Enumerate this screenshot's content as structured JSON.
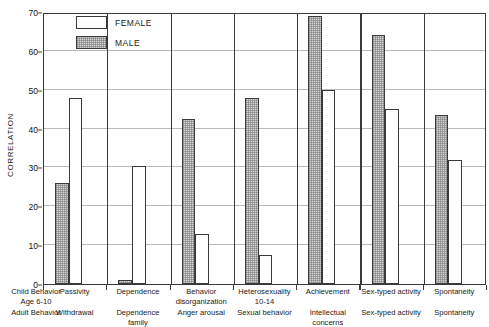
{
  "chart_data": {
    "type": "bar",
    "title": "",
    "xlabel": "",
    "ylabel": "CORRELATION",
    "ylim": [
      0,
      70
    ],
    "yticks": [
      0,
      10,
      20,
      30,
      40,
      50,
      60,
      70
    ],
    "grid": true,
    "legend_position": "top-left",
    "legend": [
      "FEMALE",
      "MALE"
    ],
    "categories": [
      "Passivity / Withdrawal",
      "Dependence / Dependence family",
      "Behavior disorganization / Anger arousal",
      "Heterosexuality 10-14 / Sexual behavior",
      "Achievement / Intellectual concerns",
      "Sex-typed activity / Sex-typed activity",
      "Spontaneity / Spontaneity"
    ],
    "series": [
      {
        "name": "MALE",
        "values": [
          26,
          1,
          42.5,
          48,
          69,
          64,
          43.5
        ]
      },
      {
        "name": "FEMALE",
        "values": [
          48,
          30.5,
          13,
          7.5,
          50,
          45,
          32
        ]
      }
    ],
    "row_headers": {
      "child": "Child Behavior",
      "child_age": "Age 6-10",
      "adult": "Adult Behavior"
    },
    "groups": [
      {
        "child_label": "Passivity",
        "child_sub": "",
        "adult_label": "Withdrawal"
      },
      {
        "child_label": "Dependence",
        "child_sub": "",
        "adult_label": "Dependence",
        "adult_sub": "family"
      },
      {
        "child_label": "Behavior",
        "child_sub": "disorganization",
        "adult_label": "Anger arousal"
      },
      {
        "child_label": "Heterosexuality",
        "child_sub": "10-14",
        "adult_label": "Sexual behavior"
      },
      {
        "child_label": "Achievement",
        "child_sub": "",
        "adult_label": "Intellectual",
        "adult_sub": "concerns"
      },
      {
        "child_label": "Sex-typed activity",
        "child_sub": "",
        "adult_label": "Sex-typed activity"
      },
      {
        "child_label": "Spontaneity",
        "child_sub": "",
        "adult_label": "Spontaneity"
      }
    ]
  },
  "colors": {
    "male_fill": "#d4d4d4",
    "female_fill": "#ffffff",
    "axis": "#3a3a3a",
    "grid": "#b9b9b9",
    "text": "#1a1a1a"
  }
}
